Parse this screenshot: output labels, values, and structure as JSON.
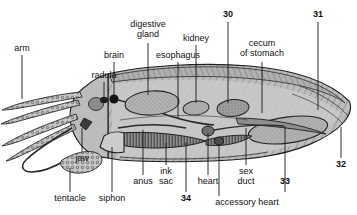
{
  "figure": {
    "kind": "anatomical-diagram",
    "style": "grayscale line drawing with stipple and hatch shading",
    "background_color": "#ffffff",
    "ink_color": "#111111",
    "body_fill": "#b9b9b9",
    "organ_fill": "#9a9a9a",
    "leader_color": "#1a1a1a"
  },
  "labels": {
    "arm": "arm",
    "radula": "radula",
    "brain": "brain",
    "digestive_gland_line1": "digestive",
    "digestive_gland_line2": "gland",
    "esophagus": "esophagus",
    "kidney": "kidney",
    "cecum_line1": "cecum",
    "cecum_line2": "of stomach",
    "jaw": "jaw",
    "tentacle": "tentacle",
    "siphon": "siphon",
    "anus": "anus",
    "ink_sac_line1": "ink",
    "ink_sac_line2": "sac",
    "heart": "heart",
    "sex_duct_line1": "sex",
    "sex_duct_line2": "duct",
    "accessory_heart": "accessory heart",
    "num_30": "30",
    "num_31": "31",
    "num_32": "32",
    "num_33": "33",
    "num_34": "34"
  }
}
